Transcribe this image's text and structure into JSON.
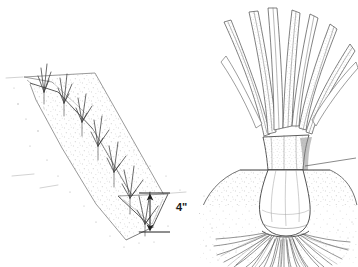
{
  "figure": {
    "background_color": "#ffffff",
    "ink_color": "#2a2a2a",
    "stipple_color": "#8d8d8d",
    "panels": [
      {
        "id": "trench-panel",
        "name": "planting-trench-perspective",
        "description": "V-shaped planting trench drawn in perspective running from upper-left to lower-right with young leek seedlings set along the trench bottom and stippled soil on both banks",
        "elements": [
          "trench-far-bank",
          "trench-near-bank",
          "trench-v-bottom",
          "seedling-row",
          "soil-stipple",
          "depth-dimension"
        ],
        "seedling_count": 7
      },
      {
        "id": "leek-panel",
        "name": "mature-leek-cross-section",
        "description": "Close-up of a single mature leek showing fanning strap leaves above, a blanched white shank buried in a mounded soil cross-section, and a dense fibrous root mass below",
        "elements": [
          "leek-leaves",
          "leek-sheath",
          "soil-mound",
          "soil-line-leader",
          "blanched-shank",
          "fibrous-roots"
        ],
        "leaf_count": 9
      }
    ]
  },
  "annotations": {
    "depth": {
      "label": "4\"",
      "value": 4,
      "unit": "inch",
      "name": "trench-depth-dimension",
      "arrow": "double-headed-vertical"
    }
  }
}
